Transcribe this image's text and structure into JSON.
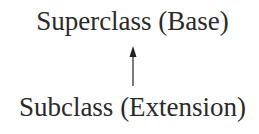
{
  "diagram": {
    "nodes": [
      {
        "id": "superclass",
        "label": "Superclass (Base)"
      },
      {
        "id": "subclass",
        "label": "Subclass (Extension)"
      }
    ],
    "edges": [
      {
        "from": "subclass",
        "to": "superclass",
        "type": "arrow",
        "direction": "up"
      }
    ]
  }
}
